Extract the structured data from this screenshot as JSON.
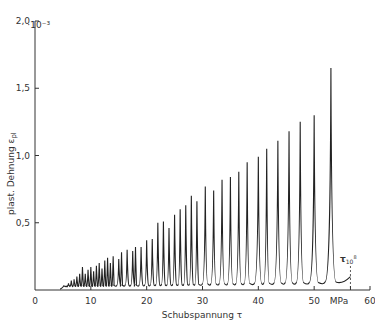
{
  "chart_data": {
    "type": "line",
    "title": "",
    "xlabel": "Schubspannung τ",
    "ylabel": "plast. Dehnung ε_pl",
    "x_unit": "MPa",
    "y_multiplier": "·10⁻³",
    "xlim": [
      0,
      60
    ],
    "ylim": [
      0,
      2.0
    ],
    "x_ticks": [
      0,
      10,
      20,
      30,
      40,
      50,
      60
    ],
    "x_tick_labels": [
      "0",
      "10",
      "20",
      "30",
      "40",
      "50",
      "MPa",
      "60"
    ],
    "y_ticks": [
      0,
      0.5,
      1.0,
      1.5,
      2.0
    ],
    "y_tick_labels": [
      "0",
      "0,5",
      "1,0",
      "1,5",
      "2,0"
    ],
    "grid": false,
    "legend": null,
    "annotations": [
      {
        "text": "τ",
        "subscript": "10",
        "superscript": "8",
        "x": 56.5,
        "note": "dashed vertical marker"
      }
    ],
    "series": [
      {
        "name": "plast. Dehnung",
        "peaks": [
          {
            "x": 5.5,
            "y": 0.03
          },
          {
            "x": 6.0,
            "y": 0.05
          },
          {
            "x": 6.5,
            "y": 0.07
          },
          {
            "x": 7.0,
            "y": 0.08
          },
          {
            "x": 7.5,
            "y": 0.1
          },
          {
            "x": 8.0,
            "y": 0.12
          },
          {
            "x": 8.5,
            "y": 0.17
          },
          {
            "x": 9.0,
            "y": 0.12
          },
          {
            "x": 9.5,
            "y": 0.15
          },
          {
            "x": 10.0,
            "y": 0.17
          },
          {
            "x": 10.5,
            "y": 0.14
          },
          {
            "x": 11.0,
            "y": 0.18
          },
          {
            "x": 11.5,
            "y": 0.2
          },
          {
            "x": 12.0,
            "y": 0.16
          },
          {
            "x": 12.5,
            "y": 0.22
          },
          {
            "x": 13.0,
            "y": 0.24
          },
          {
            "x": 13.5,
            "y": 0.2
          },
          {
            "x": 14.0,
            "y": 0.25
          },
          {
            "x": 15.0,
            "y": 0.23
          },
          {
            "x": 15.5,
            "y": 0.28
          },
          {
            "x": 16.5,
            "y": 0.3
          },
          {
            "x": 17.5,
            "y": 0.29
          },
          {
            "x": 18.0,
            "y": 0.32
          },
          {
            "x": 19.0,
            "y": 0.32
          },
          {
            "x": 20.0,
            "y": 0.37
          },
          {
            "x": 21.0,
            "y": 0.38
          },
          {
            "x": 22.0,
            "y": 0.5
          },
          {
            "x": 23.0,
            "y": 0.51
          },
          {
            "x": 24.0,
            "y": 0.46
          },
          {
            "x": 25.0,
            "y": 0.56
          },
          {
            "x": 26.0,
            "y": 0.6
          },
          {
            "x": 27.0,
            "y": 0.63
          },
          {
            "x": 28.0,
            "y": 0.7
          },
          {
            "x": 29.0,
            "y": 0.66
          },
          {
            "x": 30.5,
            "y": 0.77
          },
          {
            "x": 32.0,
            "y": 0.74
          },
          {
            "x": 33.5,
            "y": 0.82
          },
          {
            "x": 35.0,
            "y": 0.84
          },
          {
            "x": 36.5,
            "y": 0.88
          },
          {
            "x": 38.0,
            "y": 0.95
          },
          {
            "x": 40.0,
            "y": 0.99
          },
          {
            "x": 41.5,
            "y": 1.05
          },
          {
            "x": 43.5,
            "y": 1.11
          },
          {
            "x": 45.5,
            "y": 1.18
          },
          {
            "x": 47.5,
            "y": 1.25
          },
          {
            "x": 50.0,
            "y": 1.3
          },
          {
            "x": 53.0,
            "y": 1.65
          }
        ],
        "baseline": 0.03,
        "end": {
          "x": 56.5,
          "y": 0.1
        }
      }
    ]
  },
  "labels": {
    "y_unit": "·10⁻³",
    "y_axis": "plast. Dehnung ε",
    "y_axis_sub": "pl",
    "x_axis": "Schubspannung τ",
    "x_unit": "MPa",
    "marker_symbol": "τ",
    "marker_sub": "10",
    "marker_sup": "8"
  }
}
